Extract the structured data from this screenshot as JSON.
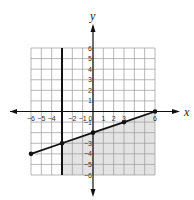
{
  "chart_data": {
    "type": "line",
    "title": "",
    "xlabel": "x",
    "ylabel": "y",
    "xlim": [
      -6,
      6
    ],
    "ylim": [
      -6,
      6
    ],
    "grid": true,
    "x_ticks": [
      -6,
      -5,
      -4,
      -2,
      -1,
      0,
      1,
      2,
      3,
      6
    ],
    "x_tick_labels": [
      "−6",
      "−5",
      "−4",
      "−2",
      "−1",
      "0",
      "1",
      "2",
      "3",
      "6"
    ],
    "y_ticks": [
      6,
      5,
      4,
      3,
      2,
      1,
      -1,
      -3,
      -4,
      -5,
      -6
    ],
    "y_tick_labels": [
      "6",
      "5",
      "4",
      "3",
      "2",
      "1",
      "−1",
      "−3",
      "−4",
      "−5",
      "−6"
    ],
    "series": [
      {
        "name": "boundary line y = (1/3)x − 2",
        "style": "solid",
        "points": [
          [
            -6,
            -4
          ],
          [
            -3,
            -3
          ],
          [
            0,
            -2
          ],
          [
            3,
            -1
          ],
          [
            6,
            0
          ]
        ]
      },
      {
        "name": "boundary line x = −3",
        "style": "solid",
        "points": [
          [
            -3,
            -6
          ],
          [
            -3,
            6
          ]
        ]
      }
    ],
    "shaded_region": {
      "description": "x ≥ −3 and y ≤ (1/3)x − 2",
      "vertices": [
        [
          -3,
          -3
        ],
        [
          6,
          0
        ],
        [
          6,
          -6
        ],
        [
          -3,
          -6
        ]
      ],
      "color": "#e3e3e3"
    },
    "colors": {
      "grid": "#9a9a9a",
      "line": "#111111",
      "shade": "#e3e3e3"
    }
  }
}
